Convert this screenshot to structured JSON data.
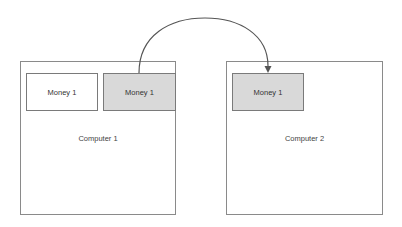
{
  "diagram": {
    "computers": [
      {
        "label": "Computer 1",
        "items": [
          {
            "label": "Money 1",
            "fill": "#ffffff"
          },
          {
            "label": "Money 1",
            "fill": "#d9d9d9"
          }
        ]
      },
      {
        "label": "Computer 2",
        "items": [
          {
            "label": "Money 1",
            "fill": "#d9d9d9"
          }
        ]
      }
    ],
    "edges": [
      {
        "from": "Computer 1 / Money 1 (gray)",
        "to": "Computer 2 / Money 1 (gray)",
        "style": "curved-arrow"
      }
    ],
    "colors": {
      "stroke": "#7a7a7a",
      "highlight_fill": "#d9d9d9",
      "arrow": "#555555"
    }
  }
}
